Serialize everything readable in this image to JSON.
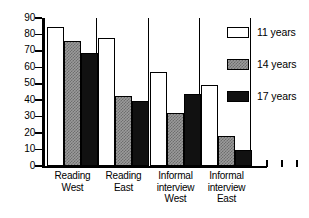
{
  "chart_data": {
    "type": "bar",
    "title": "",
    "xlabel": "",
    "ylabel": "",
    "ylim": [
      0,
      90
    ],
    "yticks": [
      0,
      10,
      20,
      30,
      40,
      50,
      60,
      70,
      80,
      90
    ],
    "grid": false,
    "legend_position": "top-right",
    "categories": [
      "Reading West",
      "Reading East",
      "Informal interview West",
      "Informal interview East"
    ],
    "category_lines": [
      [
        "Reading",
        "West"
      ],
      [
        "Reading",
        "East"
      ],
      [
        "Informal",
        "interview",
        "West"
      ],
      [
        "Informal",
        "interview",
        "East"
      ]
    ],
    "series": [
      {
        "name": "11 years",
        "color": "#ffffff",
        "values": [
          84.5,
          78,
          57,
          49.5
        ]
      },
      {
        "name": "14 years",
        "color": "#9b9b9b",
        "values": [
          76,
          42.5,
          32,
          18.5
        ]
      },
      {
        "name": "17 years",
        "color": "#111111",
        "values": [
          69,
          39.5,
          43.5,
          9.5
        ]
      }
    ]
  },
  "legend": {
    "items": [
      {
        "label": "11 years"
      },
      {
        "label": "14 years"
      },
      {
        "label": "17 years"
      }
    ]
  },
  "axis": {
    "y_tick_labels": [
      "90",
      "80",
      "70",
      "60",
      "50",
      "40",
      "30",
      "20",
      "10",
      "0"
    ]
  }
}
